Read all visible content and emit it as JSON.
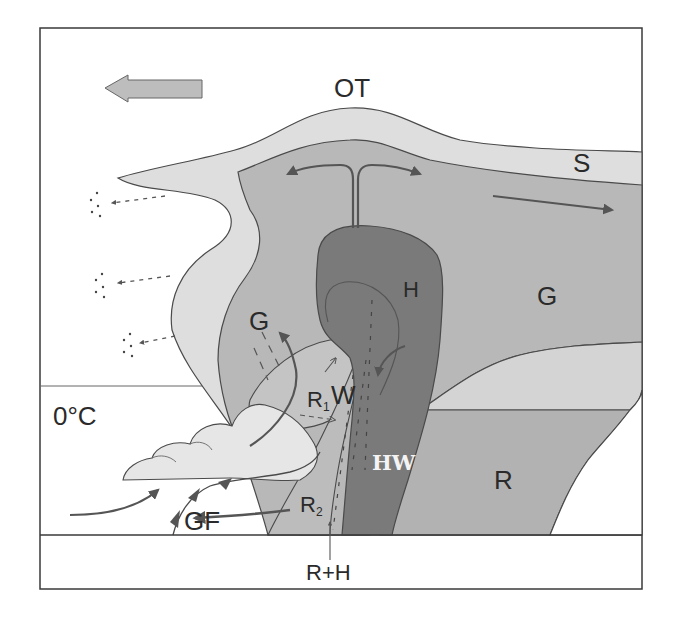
{
  "diagram": {
    "labels": {
      "overshooting_top": "OT",
      "snow": "S",
      "graupel_upper": "G",
      "graupel_left": "G",
      "hail": "H",
      "wet_snow": "W",
      "rain_1": "R",
      "rain_1_sub": "1",
      "rain_2": "R",
      "rain_2_sub": "2",
      "hail_water": "HW",
      "rain": "R",
      "freezing_level": "0°C",
      "gust_front": "GF",
      "rain_plus_hail": "R+H"
    },
    "legend_regions": [
      {
        "code": "S",
        "meaning": "Snow / ice crystals",
        "shade": "#dcdcdc"
      },
      {
        "code": "G",
        "meaning": "Graupel",
        "shade": "#b4b4b4"
      },
      {
        "code": "H",
        "meaning": "Hail",
        "shade": "#7c7c7c"
      },
      {
        "code": "W",
        "meaning": "Wet snow",
        "shade": "#c6c6c6"
      },
      {
        "code": "HW",
        "meaning": "Hail + water",
        "shade": "#6e6e6e"
      },
      {
        "code": "R",
        "meaning": "Rain",
        "shade": "#b0b0b0"
      }
    ],
    "storm_motion": "leftward",
    "colors": {
      "frame": "#3a3a3a",
      "outline": "#4a4a4a",
      "light": "#dcdcdc",
      "medium": "#b8b8b8",
      "dark": "#7a7a7a",
      "arrow": "#555555",
      "motion_arrow_fill": "#bdbdbd"
    }
  }
}
